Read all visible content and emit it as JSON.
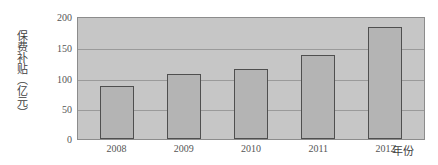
{
  "chart_data": {
    "type": "bar",
    "title": "",
    "xlabel": "年份",
    "ylabel": "保费补贴（亿元）",
    "categories": [
      "2008",
      "2009",
      "2010",
      "2011",
      "2012"
    ],
    "values": [
      87,
      107,
      115,
      139,
      185
    ],
    "ylim": [
      0,
      200
    ],
    "yticks": [
      "0",
      "50",
      "100",
      "150",
      "200"
    ],
    "ytick_values": [
      0,
      50,
      100,
      150,
      200
    ],
    "grid": true,
    "legend": false,
    "colors": {
      "bar_fill": "#b4b4b4",
      "bar_border": "#4f4f4f",
      "plot_background": "#c6c6c6",
      "gridline": "#9a9a9a",
      "axis_border": "#8c8c8c",
      "text": "#555555"
    }
  }
}
